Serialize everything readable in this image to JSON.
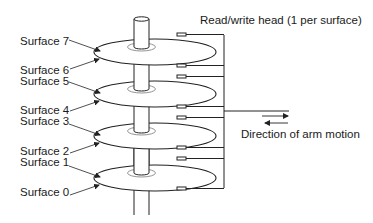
{
  "title": "Read/write head (1 per surface)",
  "arm_motion_label": "Direction of arm motion",
  "surfaces": [
    {
      "label": "Surface 7"
    },
    {
      "label": "Surface 6"
    },
    {
      "label": "Surface 5"
    },
    {
      "label": "Surface 4"
    },
    {
      "label": "Surface 3"
    },
    {
      "label": "Surface 2"
    },
    {
      "label": "Surface 1"
    },
    {
      "label": "Surface 0"
    }
  ],
  "colors": {
    "line": "#222222",
    "inner_ring": "#888888",
    "background": "#ffffff"
  }
}
